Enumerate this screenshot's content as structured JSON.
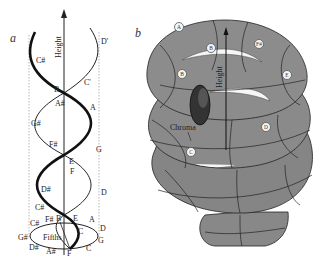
{
  "panel_a": {
    "label": "a",
    "axis_label": "Height",
    "base_label": "Fifths",
    "helix_notes": [
      "D'",
      "C#",
      "C'",
      "B",
      "A#",
      "A",
      "G#",
      "G",
      "F#",
      "E",
      "F",
      "D#",
      "D",
      "C#",
      "C",
      "B"
    ],
    "base_notes": [
      "C#",
      "F#",
      "B",
      "E",
      "A",
      "D",
      "G",
      "C",
      "F",
      "A#",
      "D#",
      "G#"
    ]
  },
  "panel_b": {
    "label": "b",
    "axis_label": "Height",
    "chroma_label": "Chroma",
    "nodes": [
      "A",
      "B",
      "F#",
      "B",
      "E",
      "D",
      "C"
    ]
  }
}
